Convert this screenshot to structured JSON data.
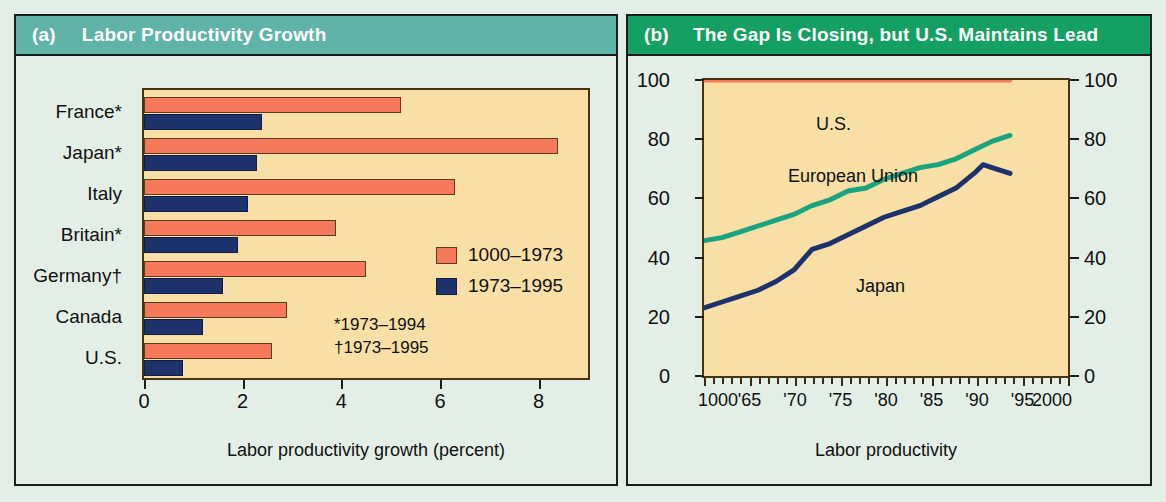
{
  "panel_a": {
    "tag": "(a)",
    "title": "Labor Productivity Growth",
    "header_color": "#5fb3a8",
    "plot_bg": "#f7dfa6",
    "axis_title": "Labor productivity growth (percent)",
    "legend": [
      {
        "label": "1000–1973",
        "color": "#f5795a"
      },
      {
        "label": "1973–1995",
        "color": "#1d326d"
      }
    ],
    "footnotes": [
      "*1973–1994",
      "†1973–1995"
    ],
    "xticks": [
      "0",
      "2",
      "4",
      "6",
      "8"
    ]
  },
  "panel_b": {
    "tag": "(b)",
    "title": "The Gap Is Closing, but U.S. Maintains Lead",
    "header_color": "#13a062",
    "plot_bg": "#f7dfa6",
    "axis_title": "Labor productivity",
    "yticks": [
      "0",
      "20",
      "40",
      "60",
      "80",
      "100"
    ],
    "xticks": [
      "1000",
      "'65",
      "'70",
      "'75",
      "'80",
      "'85",
      "'90",
      "'95",
      "2000"
    ],
    "series_labels": {
      "us": "U.S.",
      "eu": "European Union",
      "japan": "Japan"
    }
  },
  "chart_data": [
    {
      "type": "bar",
      "title": "Labor Productivity Growth",
      "orientation": "horizontal",
      "categories": [
        "France*",
        "Japan*",
        "Italy",
        "Britain*",
        "Germany†",
        "Canada",
        "U.S."
      ],
      "series": [
        {
          "name": "1000–1973",
          "color": "#f5795a",
          "values": [
            5.2,
            8.4,
            6.3,
            3.9,
            4.5,
            2.9,
            2.6
          ]
        },
        {
          "name": "1973–1995",
          "color": "#1d326d",
          "values": [
            2.4,
            2.3,
            2.1,
            1.9,
            1.6,
            1.2,
            0.8
          ]
        }
      ],
      "xlabel": "Labor productivity growth (percent)",
      "ylabel": "",
      "xlim": [
        0,
        9
      ],
      "xticks": [
        0,
        2,
        4,
        6,
        8
      ],
      "grid": false,
      "legend_position": "inside-right"
    },
    {
      "type": "line",
      "title": "The Gap Is Closing, but U.S. Maintains Lead",
      "xlabel": "Labor productivity",
      "ylabel": "",
      "xlim": [
        1960,
        2000
      ],
      "ylim": [
        0,
        100
      ],
      "yticks": [
        0,
        20,
        40,
        60,
        80,
        100
      ],
      "xtick_labels": [
        "1000",
        "'65",
        "'70",
        "'75",
        "'80",
        "'85",
        "'90",
        "'95",
        "2000"
      ],
      "xtick_values": [
        1960,
        1965,
        1970,
        1975,
        1980,
        1985,
        1990,
        1995,
        2000
      ],
      "grid": false,
      "legend_position": "inline-annotations",
      "series": [
        {
          "name": "U.S.",
          "color": "#f5795a",
          "x": [
            1960,
            1965,
            1970,
            1975,
            1980,
            1985,
            1990,
            1994
          ],
          "y": [
            100,
            100,
            100,
            100,
            100,
            100,
            100,
            100
          ]
        },
        {
          "name": "European Union",
          "color": "#19a37e",
          "x": [
            1960,
            1962,
            1964,
            1966,
            1968,
            1970,
            1972,
            1974,
            1976,
            1978,
            1980,
            1982,
            1984,
            1986,
            1988,
            1990,
            1992,
            1994
          ],
          "y": [
            45,
            46,
            48,
            50,
            52,
            54,
            57,
            59,
            62,
            63,
            66,
            68,
            70,
            71,
            73,
            76,
            79,
            81
          ]
        },
        {
          "name": "Japan",
          "color": "#1d326d",
          "x": [
            1960,
            1962,
            1964,
            1966,
            1968,
            1970,
            1972,
            1974,
            1976,
            1978,
            1980,
            1982,
            1984,
            1986,
            1988,
            1990,
            1991,
            1992,
            1994
          ],
          "y": [
            22,
            24,
            26,
            28,
            31,
            35,
            42,
            44,
            47,
            50,
            53,
            55,
            57,
            60,
            63,
            68,
            71,
            70,
            68
          ]
        }
      ]
    }
  ]
}
